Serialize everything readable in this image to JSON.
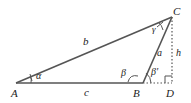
{
  "diagram": {
    "type": "triangle-geometry",
    "vertices": {
      "A": "A",
      "B": "B",
      "C": "C",
      "D": "D"
    },
    "sides": {
      "a": "a",
      "b": "b",
      "c": "c",
      "h": "h"
    },
    "angles": {
      "alpha": "α",
      "beta": "β",
      "beta_prime": "β′",
      "gamma": "γ"
    },
    "colors": {
      "line": "#555555",
      "text": "#222222"
    }
  }
}
